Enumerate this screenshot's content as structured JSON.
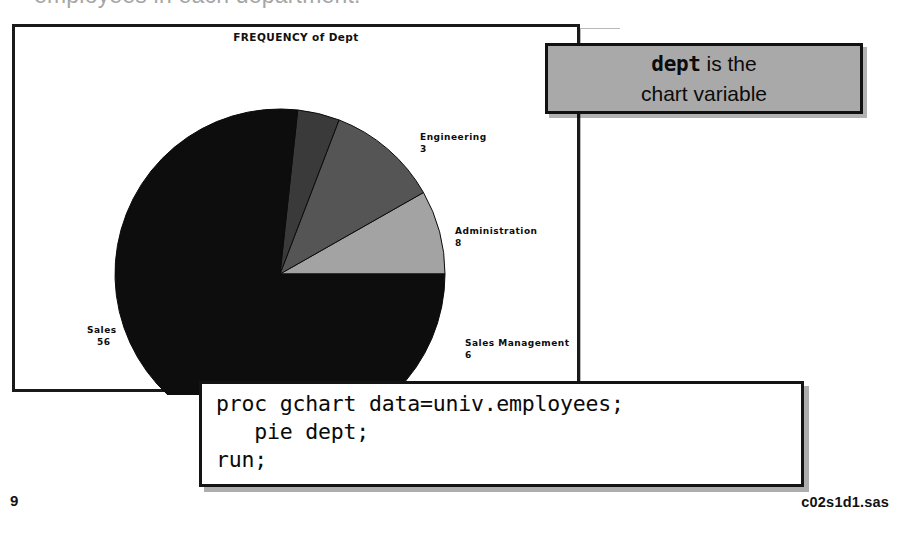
{
  "slide": {
    "top_heading_fragment": "employees in each department.",
    "page_number": "9",
    "file_name": "c02s1d1.sas"
  },
  "callout": {
    "code_word": "dept",
    "line1_rest": " is the",
    "line2": "chart variable",
    "box_fill": "#a9a9a9",
    "box_border": "#111111"
  },
  "code_box": {
    "code": "proc gchart data=univ.employees;\n   pie dept;\nrun;",
    "line1": "proc gchart data=univ.employees;",
    "line2": "   pie dept;",
    "line3": "run;"
  },
  "chart_data": {
    "type": "pie",
    "title": "FREQUENCY of Dept",
    "xlabel": "",
    "ylabel": "",
    "legend_position": "none",
    "grid": false,
    "labels_outside": true,
    "total": 73,
    "categories": [
      "Sales Management",
      "Administration",
      "Engineering",
      "Sales"
    ],
    "values": [
      6,
      8,
      3,
      56
    ],
    "percentages": [
      8.2,
      11.0,
      4.1,
      76.7
    ],
    "colors": [
      "#a3a3a3",
      "#555555",
      "#3a3a3a",
      "#0d0d0d"
    ],
    "start_angle_deg": 0,
    "direction": "counterclockwise",
    "slices": [
      {
        "label": "Sales Management",
        "value": "6",
        "color": "#a3a3a3"
      },
      {
        "label": "Administration",
        "value": "8",
        "color": "#555555"
      },
      {
        "label": "Engineering",
        "value": "3",
        "color": "#3a3a3a"
      },
      {
        "label": "Sales",
        "value": "56",
        "color": "#0d0d0d"
      }
    ]
  }
}
